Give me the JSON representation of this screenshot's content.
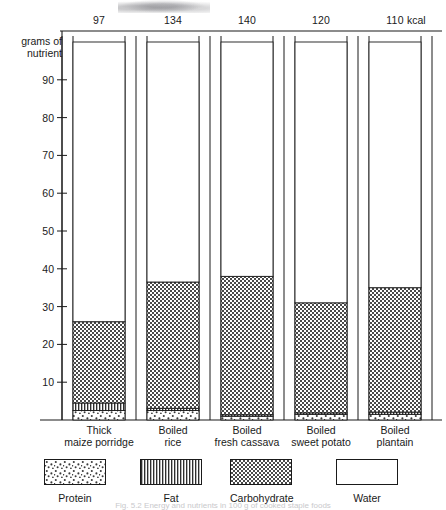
{
  "figure": {
    "y_axis_caption_line1": "grams of",
    "y_axis_caption_line2": "nutrient",
    "kcal_unit_label": "kcal",
    "caption": "Fig. 5.2 Energy and nutrients in 100 g of cooked staple foods"
  },
  "legend": {
    "items": [
      {
        "key": "protein",
        "label": "Protein",
        "pattern": "dots"
      },
      {
        "key": "fat",
        "label": "Fat",
        "pattern": "vertical-stripes"
      },
      {
        "key": "carbohydrate",
        "label": "Carbohydrate",
        "pattern": "checker"
      },
      {
        "key": "water",
        "label": "Water",
        "pattern": "blank"
      }
    ]
  },
  "chart_data": {
    "type": "bar",
    "subtype": "stacked-vertical",
    "title": "",
    "xlabel": "",
    "ylabel": "grams of nutrient",
    "ylim": [
      0,
      100
    ],
    "yticks": [
      10,
      20,
      30,
      40,
      50,
      60,
      70,
      80,
      90
    ],
    "grid": false,
    "legend_position": "below-plot",
    "categories": [
      "Thick maize porridge",
      "Boiled rice",
      "Boiled fresh cassava",
      "Boiled sweet potato",
      "Boiled plantain"
    ],
    "category_lines": [
      [
        "Thick",
        "maize  porridge"
      ],
      [
        "Boiled",
        "rice"
      ],
      [
        "Boiled",
        "fresh cassava"
      ],
      [
        "Boiled",
        "sweet potato"
      ],
      [
        "Boiled",
        "plantain"
      ]
    ],
    "secondary_axis": {
      "name": "energy",
      "unit": "kcal",
      "position": "top",
      "values": [
        97,
        134,
        140,
        120,
        110
      ]
    },
    "series": [
      {
        "name": "Protein",
        "values": [
          2.5,
          2.5,
          1.0,
          1.5,
          1.5
        ]
      },
      {
        "name": "Fat",
        "values": [
          2.0,
          0.6,
          0.4,
          0.4,
          0.6
        ]
      },
      {
        "name": "Carbohydrate",
        "values": [
          21.5,
          33.4,
          36.6,
          29.1,
          32.9
        ]
      },
      {
        "name": "Water",
        "values": [
          74.0,
          63.5,
          62.0,
          69.0,
          65.0
        ]
      }
    ],
    "totals_visible_nutrients": [
      26.0,
      36.5,
      38.0,
      31.0,
      35.0
    ]
  }
}
